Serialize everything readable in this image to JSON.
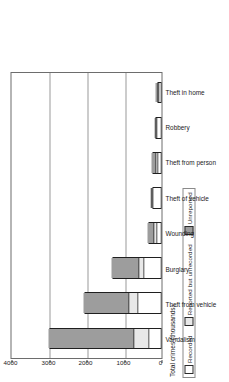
{
  "legend": {
    "items": [
      {
        "label": "Recorded",
        "color": "#ffffff",
        "icon": "square-swatch-icon"
      },
      {
        "label": "Reported but unrecorded",
        "color": "#e8e8e8",
        "icon": "square-swatch-icon"
      },
      {
        "label": "Unreported",
        "color": "#9d9d9d",
        "icon": "square-swatch-icon"
      }
    ]
  },
  "axis": {
    "value_title": "Total crimes (thousands)",
    "ticks": [
      "0",
      "1000",
      "2000",
      "3000",
      "4000"
    ]
  },
  "chart_data": {
    "type": "bar",
    "subtype": "stacked-horizontal",
    "orientation": "rotated-90-ccw",
    "title": "",
    "xlabel": "",
    "ylabel": "Total crimes (thousands)",
    "ylim": [
      0,
      4000
    ],
    "ytick_values": [
      0,
      1000,
      2000,
      3000,
      4000
    ],
    "grid": true,
    "legend_position": "outside-left",
    "categories": [
      "Vandalism",
      "Theft from vehicle",
      "Burglary",
      "Wounding",
      "Theft of vehicle",
      "Theft from person",
      "Robbery",
      "Theft in home"
    ],
    "series": [
      {
        "name": "Recorded",
        "color": "#ffffff",
        "values": [
          300,
          600,
          420,
          80,
          200,
          60,
          70,
          25
        ]
      },
      {
        "name": "Reported but unrecorded",
        "color": "#e8e8e8",
        "values": [
          390,
          230,
          130,
          70,
          20,
          40,
          30,
          5
        ]
      },
      {
        "name": "Unreported",
        "color": "#9d9d9d",
        "values": [
          2310,
          1220,
          770,
          210,
          30,
          150,
          55,
          70
        ]
      }
    ],
    "totals": [
      3000,
      2050,
      1320,
      360,
      250,
      250,
      155,
      100
    ]
  }
}
